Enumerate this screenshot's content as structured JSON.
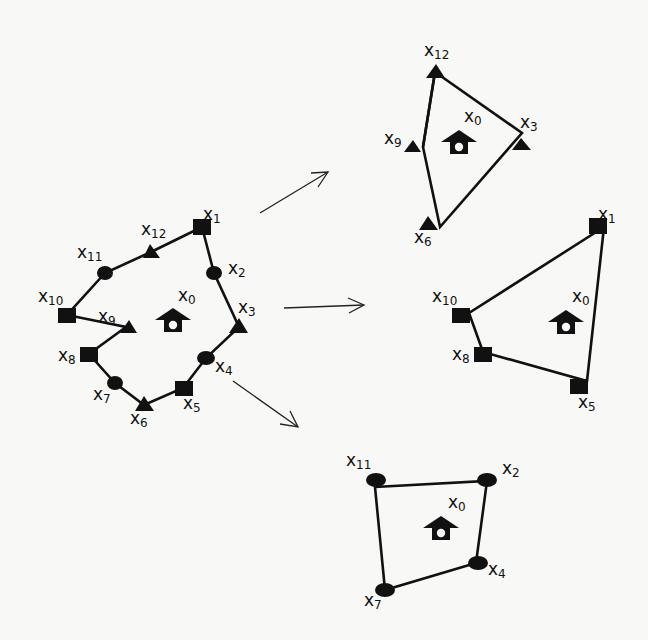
{
  "diagram": {
    "type": "graph-decomposition",
    "node_shapes": {
      "square": "square",
      "triangle": "triangle",
      "circle": "ellipse"
    },
    "center_label": {
      "base": "x",
      "sub": "0"
    },
    "main_graph": {
      "nodes": [
        {
          "id": "x1",
          "base": "x",
          "sub": "1",
          "shape": "square"
        },
        {
          "id": "x2",
          "base": "x",
          "sub": "2",
          "shape": "circle"
        },
        {
          "id": "x3",
          "base": "x",
          "sub": "3",
          "shape": "triangle"
        },
        {
          "id": "x4",
          "base": "x",
          "sub": "4",
          "shape": "circle"
        },
        {
          "id": "x5",
          "base": "x",
          "sub": "5",
          "shape": "square"
        },
        {
          "id": "x6",
          "base": "x",
          "sub": "6",
          "shape": "triangle"
        },
        {
          "id": "x7",
          "base": "x",
          "sub": "7",
          "shape": "circle"
        },
        {
          "id": "x8",
          "base": "x",
          "sub": "8",
          "shape": "square"
        },
        {
          "id": "x9",
          "base": "x",
          "sub": "9",
          "shape": "triangle"
        },
        {
          "id": "x10",
          "base": "x",
          "sub": "10",
          "shape": "square"
        },
        {
          "id": "x11",
          "base": "x",
          "sub": "11",
          "shape": "circle"
        },
        {
          "id": "x12",
          "base": "x",
          "sub": "12",
          "shape": "triangle"
        }
      ],
      "edges": [
        [
          "x1",
          "x2"
        ],
        [
          "x2",
          "x3"
        ],
        [
          "x3",
          "x4"
        ],
        [
          "x4",
          "x5"
        ],
        [
          "x5",
          "x6"
        ],
        [
          "x6",
          "x7"
        ],
        [
          "x7",
          "x8"
        ],
        [
          "x8",
          "x9"
        ],
        [
          "x9",
          "x10"
        ],
        [
          "x10",
          "x11"
        ],
        [
          "x11",
          "x12"
        ],
        [
          "x12",
          "x1"
        ]
      ]
    },
    "sub_graphs": [
      {
        "name": "triangles",
        "nodes": [
          {
            "id": "x12",
            "base": "x",
            "sub": "12"
          },
          {
            "id": "x3",
            "base": "x",
            "sub": "3"
          },
          {
            "id": "x6",
            "base": "x",
            "sub": "6"
          },
          {
            "id": "x9",
            "base": "x",
            "sub": "9"
          }
        ],
        "edges": [
          [
            "x12",
            "x3"
          ],
          [
            "x3",
            "x6"
          ],
          [
            "x6",
            "x9"
          ],
          [
            "x9",
            "x12"
          ]
        ]
      },
      {
        "name": "squares",
        "nodes": [
          {
            "id": "x1",
            "base": "x",
            "sub": "1"
          },
          {
            "id": "x5",
            "base": "x",
            "sub": "5"
          },
          {
            "id": "x8",
            "base": "x",
            "sub": "8"
          },
          {
            "id": "x10",
            "base": "x",
            "sub": "10"
          }
        ],
        "edges": [
          [
            "x1",
            "x5"
          ],
          [
            "x5",
            "x8"
          ],
          [
            "x8",
            "x10"
          ],
          [
            "x10",
            "x1"
          ]
        ]
      },
      {
        "name": "circles",
        "nodes": [
          {
            "id": "x11",
            "base": "x",
            "sub": "11"
          },
          {
            "id": "x2",
            "base": "x",
            "sub": "2"
          },
          {
            "id": "x4",
            "base": "x",
            "sub": "4"
          },
          {
            "id": "x7",
            "base": "x",
            "sub": "7"
          }
        ],
        "edges": [
          [
            "x11",
            "x2"
          ],
          [
            "x2",
            "x4"
          ],
          [
            "x4",
            "x7"
          ],
          [
            "x7",
            "x11"
          ]
        ]
      }
    ],
    "arrows": 3
  },
  "labels": {
    "m": {
      "x0": {
        "b": "x",
        "s": "0"
      },
      "x1": {
        "b": "x",
        "s": "1"
      },
      "x2": {
        "b": "x",
        "s": "2"
      },
      "x3": {
        "b": "x",
        "s": "3"
      },
      "x4": {
        "b": "x",
        "s": "4"
      },
      "x5": {
        "b": "x",
        "s": "5"
      },
      "x6": {
        "b": "x",
        "s": "6"
      },
      "x7": {
        "b": "x",
        "s": "7"
      },
      "x8": {
        "b": "x",
        "s": "8"
      },
      "x9": {
        "b": "x",
        "s": "9"
      },
      "x10": {
        "b": "x",
        "s": "10"
      },
      "x11": {
        "b": "x",
        "s": "11"
      },
      "x12": {
        "b": "x",
        "s": "12"
      }
    }
  }
}
